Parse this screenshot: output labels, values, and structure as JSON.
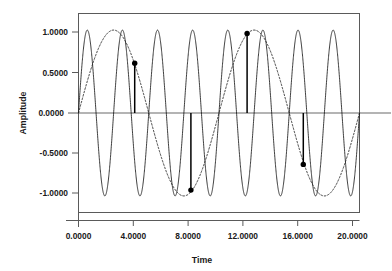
{
  "figure": {
    "background_color": "#ffffff",
    "frame_color": "#5a5a5a"
  },
  "chart_data": {
    "type": "line",
    "title": "",
    "xlabel": "Time",
    "ylabel": "Amplitude",
    "xlim": [
      0,
      20
    ],
    "ylim": [
      -1.2,
      1.2
    ],
    "grid": false,
    "legend": "none",
    "xticks": [
      0,
      4,
      8,
      12,
      16,
      20
    ],
    "xticklabels": [
      "0.0000",
      "4.0000",
      "8.0000",
      "12.0000",
      "16.0000",
      "20.0000"
    ],
    "yticks": [
      1.0,
      0.5,
      0.0,
      -0.5,
      -1.0
    ],
    "yticklabels": [
      "1.0000",
      "0.5000",
      "0.0000",
      "-0.5000",
      "-1.0000"
    ],
    "series": [
      {
        "name": "carrier-sine-solid",
        "style": "solid",
        "color": "#1a1a1a",
        "form": "sine",
        "amplitude": 1.0,
        "frequency": 0.4,
        "period": 2.5,
        "phase": 0.0,
        "cycles_in_view": 8
      },
      {
        "name": "modulating-sine-dashed",
        "style": "dashed",
        "color": "#1a1a1a",
        "form": "sine",
        "amplitude": 1.0,
        "frequency": 0.1,
        "period": 10.0,
        "phase": 0.0,
        "cycles_in_view": 2
      },
      {
        "name": "sample-stems",
        "style": "stem",
        "color": "#000000",
        "x": [
          4,
          8,
          12,
          16
        ],
        "y": [
          0.6,
          -0.93,
          0.96,
          -0.62
        ]
      }
    ],
    "annotations": [
      {
        "name": "zero-baseline",
        "y": 0.0,
        "style": "solid",
        "color": "#6a6a6a"
      }
    ]
  }
}
